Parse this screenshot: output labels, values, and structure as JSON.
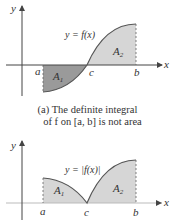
{
  "figure_a": {
    "y_axis_label": "y",
    "x_axis_label": "x",
    "curve_label": "y = f(x)",
    "region_labels": [
      "A1",
      "A2"
    ],
    "region_label_text": {
      "a1": "A",
      "a1_sub": "1",
      "a2": "A",
      "a2_sub": "2"
    },
    "tick_labels": {
      "a": "a",
      "c": "c",
      "b": "b"
    },
    "caption_line1": "(a) The definite integral",
    "caption_line2": "of f on [a, b] is not area",
    "colors": {
      "region_negative": "#9a9a9a",
      "region_positive": "#d6d6d6",
      "curve": "#555555",
      "axis": "#444444"
    }
  },
  "figure_b": {
    "y_axis_label": "y",
    "x_axis_label": "x",
    "curve_label": "y = |f(x)|",
    "region_label_text": {
      "a1": "A",
      "a1_sub": "1",
      "a2": "A",
      "a2_sub": "2"
    },
    "tick_labels": {
      "a": "a",
      "c": "c",
      "b": "b"
    },
    "colors": {
      "region": "#d6d6d6",
      "curve": "#555555",
      "axis": "#444444"
    }
  }
}
